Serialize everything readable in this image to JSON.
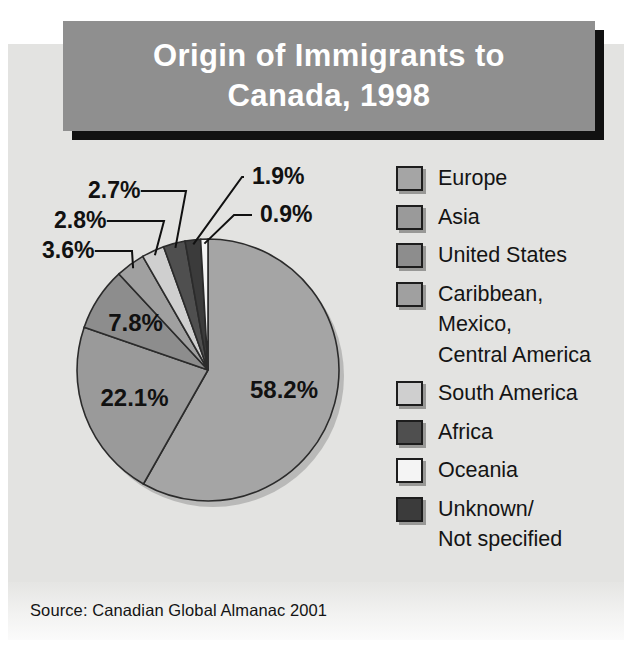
{
  "title": {
    "line1": "Origin of Immigrants to",
    "line2": "Canada, 1998"
  },
  "source": "Source: Canadian Global Almanac 2001",
  "colors": {
    "banner_bg": "#8f8f8f",
    "banner_shadow": "#111111",
    "panel_bg": "#e3e3e1",
    "title_text": "#ffffff",
    "outline": "#2b2b2b"
  },
  "legend": {
    "items": [
      {
        "label": "Europe",
        "color": "#a5a5a5"
      },
      {
        "label": "Asia",
        "color": "#9a9a9a"
      },
      {
        "label": "United States",
        "color": "#8d8d8d"
      },
      {
        "label": "Caribbean,",
        "cont1": "Mexico,",
        "cont2": "Central America",
        "color": "#a0a0a0"
      },
      {
        "label": "South America",
        "color": "#cfcfcf"
      },
      {
        "label": "Africa",
        "color": "#4f4f4f"
      },
      {
        "label": "Oceania",
        "color": "#f4f4f4"
      },
      {
        "label": "Unknown/",
        "cont1": "Not specified",
        "color": "#3b3b3b"
      }
    ]
  },
  "chart_data": {
    "type": "pie",
    "title": "Origin of Immigrants to Canada, 1998",
    "unit": "%",
    "total": 100,
    "start_angle_deg": 0,
    "direction": "clockwise",
    "categories": [
      "Europe",
      "Asia",
      "United States",
      "Caribbean, Mexico, Central America",
      "South America",
      "Africa",
      "Unknown/Not specified",
      "Oceania"
    ],
    "values": [
      58.2,
      22.1,
      7.8,
      3.6,
      2.8,
      2.7,
      1.9,
      0.9
    ],
    "labels": [
      "58.2%",
      "22.1%",
      "7.8%",
      "3.6%",
      "2.8%",
      "2.7%",
      "1.9%",
      "0.9%"
    ],
    "slice_colors": [
      "#a5a5a5",
      "#9a9a9a",
      "#8d8d8d",
      "#a0a0a0",
      "#cfcfcf",
      "#4f4f4f",
      "#3b3b3b",
      "#f4f4f4"
    ],
    "inside_labels": [
      "58.2%",
      "22.1%",
      "7.8%"
    ],
    "callout_labels": [
      "3.6%",
      "2.8%",
      "2.7%",
      "1.9%",
      "0.9%"
    ],
    "legend_position": "right",
    "grid": false
  }
}
